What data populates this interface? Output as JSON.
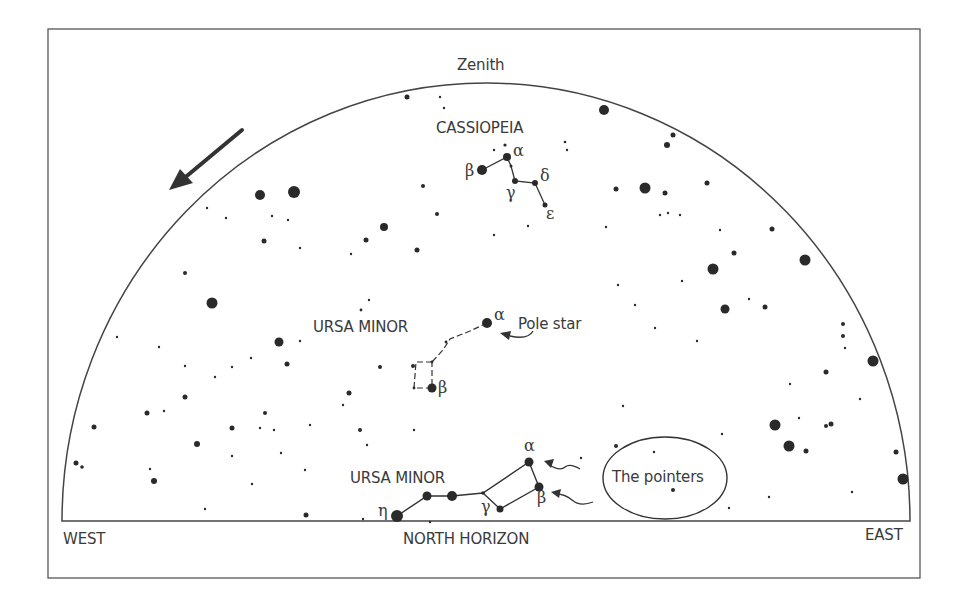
{
  "diagram": {
    "title_label": "Zenith",
    "horizon_label": "NORTH HORIZON",
    "west_label": "WEST",
    "east_label": "EAST",
    "rotation_arrow": "counterclockwise-arrow",
    "colors": {
      "ink": "#3a3a3a",
      "star": "#2a2a2a",
      "background": "#ffffff"
    },
    "constellations": {
      "cassiopeia": {
        "name": "CASSIOPEIA",
        "stars": [
          {
            "greek": "β",
            "x": 482,
            "y": 170,
            "r": 5
          },
          {
            "greek": "α",
            "x": 507,
            "y": 157,
            "r": 4
          },
          {
            "greek": "γ",
            "x": 515,
            "y": 181,
            "r": 3
          },
          {
            "greek": "δ",
            "x": 535,
            "y": 183,
            "r": 3
          },
          {
            "greek": "ε",
            "x": 545,
            "y": 205,
            "r": 2.5
          }
        ]
      },
      "ursa_minor": {
        "name": "URSA MINOR",
        "annotation": "Pole star",
        "stars": [
          {
            "greek": "α",
            "x": 487,
            "y": 323,
            "r": 5
          },
          {
            "greek": "β",
            "x": 432,
            "y": 388,
            "r": 4.5
          }
        ]
      },
      "big_dipper": {
        "name": "URSA MINOR",
        "annotation": "The pointers",
        "stars": [
          {
            "greek": "η",
            "x": 397,
            "y": 516,
            "r": 6
          },
          {
            "greek": "",
            "x": 427,
            "y": 496,
            "r": 4.5
          },
          {
            "greek": "",
            "x": 452,
            "y": 496,
            "r": 5
          },
          {
            "greek": "γ",
            "x": 500,
            "y": 509,
            "r": 3.5
          },
          {
            "greek": "α",
            "x": 529,
            "y": 462,
            "r": 4.5
          },
          {
            "greek": "β",
            "x": 539,
            "y": 487,
            "r": 4.5
          }
        ]
      }
    }
  }
}
